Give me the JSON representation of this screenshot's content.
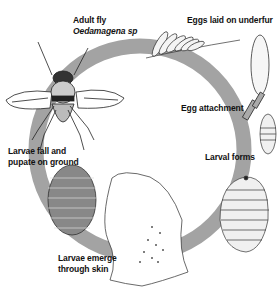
{
  "diagram": {
    "type": "life-cycle",
    "ring_color": "#a3a3a3",
    "stages": [
      {
        "id": "adult",
        "label_line1": "Adult fly",
        "label_line2": "Oedamagena sp"
      },
      {
        "id": "eggs",
        "label": "Eggs laid on underfur"
      },
      {
        "id": "egg-attachment",
        "label": "Egg attachment"
      },
      {
        "id": "larval-forms",
        "label": "Larval forms"
      },
      {
        "id": "emerge",
        "label_line1": "Larvae emerge",
        "label_line2": "through skin"
      },
      {
        "id": "pupate",
        "label_line1": "Larvae fall and",
        "label_line2": "pupate on ground"
      }
    ]
  }
}
